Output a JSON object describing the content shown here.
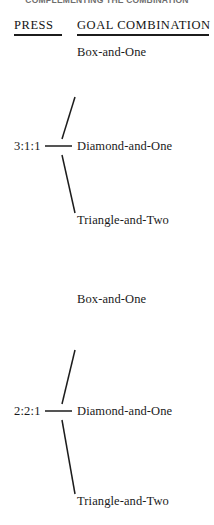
{
  "document": {
    "running_head": "COMPLEMENTING THE COMBINATION",
    "columns": {
      "press_header": "PRESS",
      "goal_header": "GOAL COMBINATION"
    },
    "groups": [
      {
        "press": "3:1:1",
        "connector_dash": "——",
        "goals": [
          "Box-and-One",
          "Diamond-and-One",
          "Triangle-and-Two"
        ]
      },
      {
        "press": "2:2:1",
        "connector_dash": "——",
        "goals": [
          "Box-and-One",
          "Diamond-and-One",
          "Triangle-and-Two"
        ]
      }
    ]
  },
  "style": {
    "ink_color": "#1a1a1a",
    "rule_color": "#1c1c1c",
    "paper_color": "#ffffff",
    "running_head_color": "#6e6e6e"
  }
}
